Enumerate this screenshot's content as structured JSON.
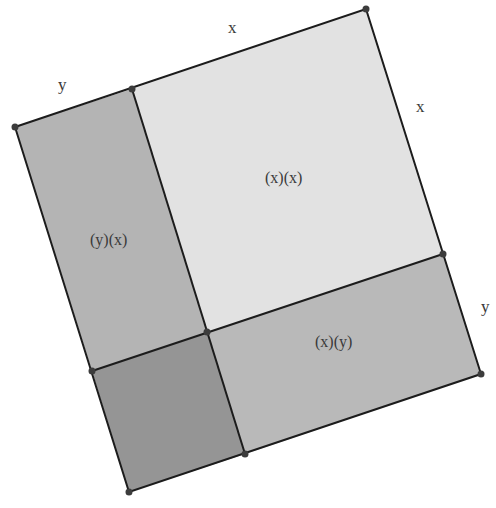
{
  "diagram": {
    "colors": {
      "xx_fill": "#e2e2e2",
      "xy_fill": "#b9b9b9",
      "yx_fill": "#b4b4b4",
      "yy_fill": "#959595",
      "stroke": "#1c1c1c",
      "point": "#3c3c3c"
    },
    "side_labels": {
      "top_y": "y",
      "top_x": "x",
      "right_x": "x",
      "right_y": "y"
    },
    "region_labels": {
      "xx": "(x)(x)",
      "yx": "(y)(x)",
      "xy": "(x)(y)",
      "yy": ""
    }
  }
}
